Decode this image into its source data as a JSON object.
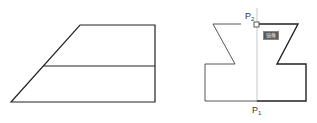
{
  "figures": {
    "left": {
      "description": "trapezoid with horizontal midline",
      "stroke_color": "#222222"
    },
    "right": {
      "description": "mirror-symmetric shape with vertical axis",
      "stroke_color": "#222222",
      "points": {
        "p2": {
          "label": "P",
          "sub": "2"
        },
        "p1": {
          "label": "P",
          "sub": "1"
        }
      },
      "badge": {
        "label": "镜像"
      }
    }
  }
}
